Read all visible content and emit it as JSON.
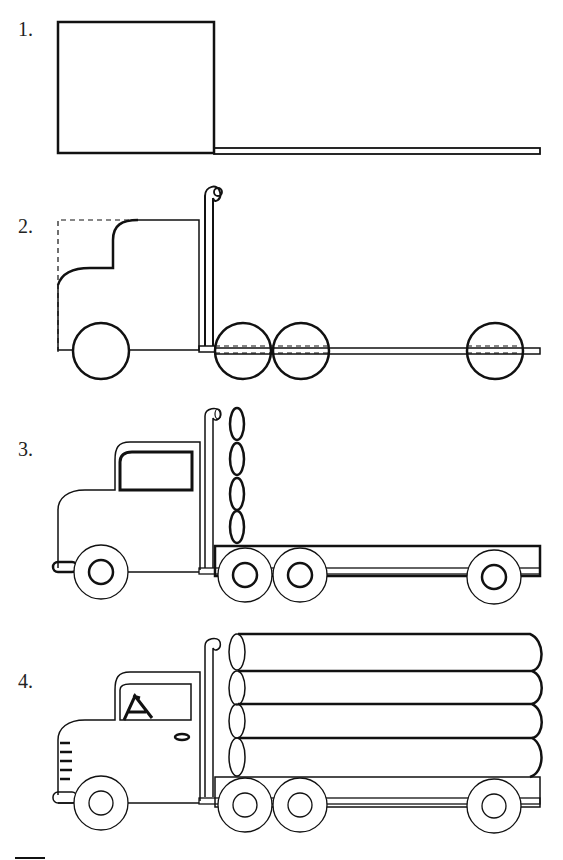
{
  "steps": [
    {
      "number": "1.",
      "description": "Cab box and chassis rail"
    },
    {
      "number": "2.",
      "description": "Cab outline, exhaust stack and wheel circles"
    },
    {
      "number": "3.",
      "description": "Window, bumper, hubs, trailer bed and log ends"
    },
    {
      "number": "4.",
      "description": "Logs, grille, driver, door handle"
    }
  ],
  "colors": {
    "line": "#111111",
    "background": "#ffffff"
  }
}
